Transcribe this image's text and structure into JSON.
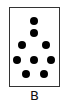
{
  "figure": {
    "label": "B",
    "box": {
      "left": 9,
      "top": 7,
      "width": 51,
      "height": 80,
      "border_color": "#333333"
    },
    "dot_color": "#000000",
    "dot_count": 10,
    "dots": [
      {
        "x": 34,
        "y": 21
      },
      {
        "x": 34,
        "y": 33
      },
      {
        "x": 22,
        "y": 45
      },
      {
        "x": 46,
        "y": 45
      },
      {
        "x": 17,
        "y": 60
      },
      {
        "x": 34,
        "y": 60
      },
      {
        "x": 51,
        "y": 60
      },
      {
        "x": 26,
        "y": 74
      },
      {
        "x": 44,
        "y": 74
      }
    ]
  }
}
